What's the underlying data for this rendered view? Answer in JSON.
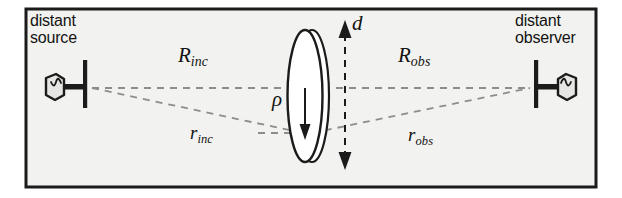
{
  "figure": {
    "kind": "scattering-geometry-diagram",
    "border_color": "#1b1b1b",
    "background_color": "#f2f2f0",
    "ray_color": "#8a8a8a",
    "ink_color": "#121212"
  },
  "labels": {
    "source": {
      "line1": "distant",
      "line2": "source"
    },
    "observer": {
      "line1": "distant",
      "line2": "observer"
    }
  },
  "symbols": {
    "R_inc": {
      "base": "R",
      "sub": "inc"
    },
    "R_obs": {
      "base": "R",
      "sub": "obs"
    },
    "r_inc": {
      "base": "r",
      "sub": "inc"
    },
    "r_obs": {
      "base": "r",
      "sub": "obs"
    },
    "rho": {
      "base": "ρ"
    },
    "d": {
      "base": "d"
    }
  },
  "icons": {
    "source_antenna": "antenna-icon",
    "observer_antenna": "antenna-icon",
    "scatterer": "disk-ellipse-shape",
    "extent_arrow": "double-headed-arrow-icon",
    "rho_arrow": "down-arrow-icon"
  }
}
